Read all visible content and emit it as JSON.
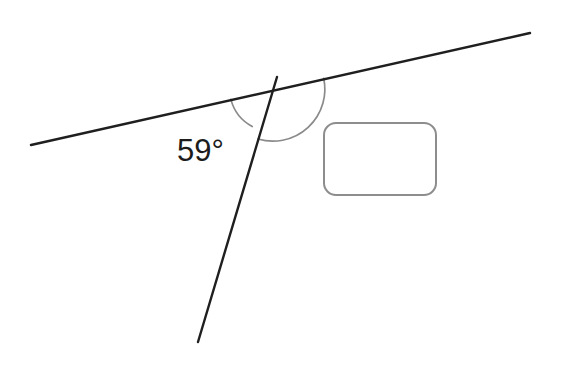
{
  "figure": {
    "type": "geometry-angle-diagram",
    "background_color": "#ffffff",
    "width": 566,
    "height": 384
  },
  "labels": {
    "marked_angle": "59°",
    "marked_angle_value": 59,
    "marked_angle_unit": "degrees"
  },
  "answer_box": {
    "value": "",
    "placeholder": "",
    "border_color": "#8d8d8d",
    "fill_color": "#ffffff",
    "x": 323,
    "y": 122,
    "width": 114,
    "height": 74,
    "corner_radius": 13
  },
  "lines": [
    {
      "name": "transversal-line",
      "x1": 31,
      "y1": 145,
      "x2": 530,
      "y2": 33,
      "color": "#1f1f1f",
      "stroke_width": 2.4
    },
    {
      "name": "steep-line",
      "x1": 277,
      "y1": 77,
      "x2": 198,
      "y2": 342,
      "color": "#1f1f1f",
      "stroke_width": 2.4
    }
  ],
  "intersection": {
    "name": "vertex",
    "x": 273,
    "y": 90
  },
  "arcs": [
    {
      "name": "marked-angle-arc",
      "radius": 43,
      "color": "#8a8a8a",
      "stroke_width": 1.7,
      "measure": 59,
      "label": "59°"
    },
    {
      "name": "unknown-angle-arc",
      "radius": 52,
      "color": "#8a8a8a",
      "stroke_width": 1.7,
      "measure": 121,
      "label": ""
    }
  ]
}
